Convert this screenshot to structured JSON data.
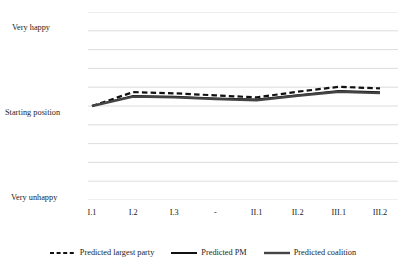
{
  "chart_data": {
    "type": "line",
    "title": "",
    "xlabel": "",
    "ylabel": "",
    "grid": true,
    "legend_position": "bottom",
    "categories": [
      "I.1",
      "I.2",
      "I.3",
      "-",
      "II.1",
      "II.2",
      "III.1",
      "III.2"
    ],
    "y_tick_labels": [
      "Very happy",
      "Starting position",
      "Very unhappy"
    ],
    "y_tick_values": [
      1,
      0,
      -1
    ],
    "ylim": [
      -1.15,
      1.15
    ],
    "gridline_count": 11,
    "series": [
      {
        "name": "Predicted largest party",
        "style": "dashed",
        "color": "#111111",
        "width": 2.2,
        "values": [
          0.0,
          0.17,
          0.155,
          0.13,
          0.105,
          0.175,
          0.235,
          0.215
        ]
      },
      {
        "name": "Predicted PM",
        "style": "solid",
        "color": "#111111",
        "width": 1.7,
        "values": [
          0.0,
          0.125,
          0.115,
          0.095,
          0.08,
          0.135,
          0.185,
          0.17
        ]
      },
      {
        "name": "Predicted coalition",
        "style": "solid",
        "color": "#444444",
        "width": 2.4,
        "values": [
          0.0,
          0.115,
          0.105,
          0.085,
          0.07,
          0.125,
          0.175,
          0.158
        ]
      }
    ]
  },
  "axis": {
    "y_labels": {
      "very_happy": "Very happy",
      "starting_position": "Starting position",
      "very_unhappy": "Very unhappy"
    },
    "x_labels": [
      "I.1",
      "I.2",
      "I.3",
      "-",
      "II.1",
      "II.2",
      "III.1",
      "III.2"
    ]
  },
  "legend": {
    "items": [
      {
        "label": "Predicted largest party",
        "swatch": "dashed-line-swatch"
      },
      {
        "label": "Predicted PM",
        "swatch": "solid-line-swatch"
      },
      {
        "label": "Predicted coalition",
        "swatch": "thick-solid-line-swatch"
      }
    ]
  },
  "colors": {
    "background": "#ffffff",
    "gridline": "#d9d9d9",
    "text": "#1c1c1c",
    "line_primary": "#111111",
    "line_secondary": "#444444"
  }
}
